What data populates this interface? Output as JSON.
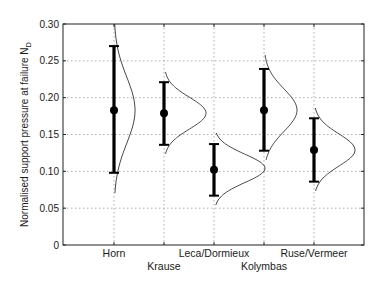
{
  "chart_data": {
    "type": "errorbar",
    "title": "",
    "xlabel": "",
    "ylabel": "Normalised support pressure at failure N",
    "ylabel_subscript": "D",
    "ylim": [
      0,
      0.3
    ],
    "yticks": [
      0,
      0.05,
      0.1,
      0.15,
      0.2,
      0.25,
      0.3
    ],
    "ytick_labels": [
      "0",
      "0.05",
      "0.10",
      "0.15",
      "0.20",
      "0.25",
      "0.30"
    ],
    "grid": true,
    "grid_style": "dotted",
    "legend": null,
    "categories": [
      "Horn",
      "Krause",
      "Leca/Dormieux",
      "Kolymbas",
      "Ruse/Vermeer"
    ],
    "category_label_row": [
      0,
      1,
      0,
      1,
      0
    ],
    "series": [
      {
        "name": "mean with range",
        "mean": [
          0.183,
          0.179,
          0.102,
          0.183,
          0.129
        ],
        "upper": [
          0.27,
          0.221,
          0.137,
          0.239,
          0.172
        ],
        "lower": [
          0.098,
          0.136,
          0.067,
          0.128,
          0.086
        ]
      }
    ],
    "distributions": [
      {
        "category": "Horn",
        "center": 0.183,
        "y_top": 0.3,
        "y_bottom": 0.07,
        "peak_width_px": 21
      },
      {
        "category": "Krause",
        "center": 0.179,
        "y_top": 0.235,
        "y_bottom": 0.123,
        "peak_width_px": 42
      },
      {
        "category": "Leca/Dormieux",
        "center": 0.104,
        "y_top": 0.152,
        "y_bottom": 0.054,
        "peak_width_px": 51
      },
      {
        "category": "Kolymbas",
        "center": 0.183,
        "y_top": 0.258,
        "y_bottom": 0.115,
        "peak_width_px": 33
      },
      {
        "category": "Ruse/Vermeer",
        "center": 0.129,
        "y_top": 0.186,
        "y_bottom": 0.072,
        "peak_width_px": 41
      }
    ],
    "colors": {
      "axis": "#222222",
      "grid": "#9a9a9a",
      "bar": "#000000",
      "curve": "#333333"
    }
  }
}
